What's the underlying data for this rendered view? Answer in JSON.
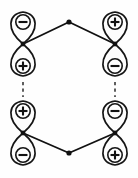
{
  "figure": {
    "background_color": "#fefefe",
    "line_color": "#111111",
    "lobe_fill_color": "#fdfdfd"
  },
  "orbitals": [
    {
      "id": "orbital-top-left",
      "name": "top-left-orbital",
      "center_x": 23,
      "node_y": 44,
      "top_lobe_sign": "−",
      "top_lobe_sign_name": "minus",
      "bottom_lobe_sign": "+",
      "bottom_lobe_sign_name": "plus"
    },
    {
      "id": "orbital-top-right",
      "name": "top-right-orbital",
      "center_x": 115,
      "node_y": 44,
      "top_lobe_sign": "+",
      "top_lobe_sign_name": "plus",
      "bottom_lobe_sign": "−",
      "bottom_lobe_sign_name": "minus"
    },
    {
      "id": "orbital-bottom-left",
      "name": "bottom-left-orbital",
      "center_x": 23,
      "node_y": 133,
      "top_lobe_sign": "+",
      "top_lobe_sign_name": "plus",
      "bottom_lobe_sign": "−",
      "bottom_lobe_sign_name": "minus"
    },
    {
      "id": "orbital-bottom-right",
      "name": "bottom-right-orbital",
      "center_x": 115,
      "node_y": 133,
      "top_lobe_sign": "−",
      "top_lobe_sign_name": "minus",
      "bottom_lobe_sign": "+",
      "bottom_lobe_sign_name": "plus"
    }
  ],
  "vertices": [
    {
      "id": "vertex-top",
      "name": "top-apex-vertex",
      "x": 69,
      "y": 22
    },
    {
      "id": "vertex-bottom",
      "name": "bottom-apex-vertex",
      "x": 69,
      "y": 153
    }
  ],
  "bonds": [
    {
      "id": "bond-top-left",
      "name": "bond-top-left",
      "x1": 23,
      "y1": 44,
      "x2": 69,
      "y2": 22,
      "style": "solid"
    },
    {
      "id": "bond-top-right",
      "name": "bond-top-right",
      "x1": 69,
      "y1": 22,
      "x2": 115,
      "y2": 44,
      "style": "solid"
    },
    {
      "id": "bond-bottom-left",
      "name": "bond-bottom-left",
      "x1": 23,
      "y1": 133,
      "x2": 69,
      "y2": 153,
      "style": "solid"
    },
    {
      "id": "bond-bottom-right",
      "name": "bond-bottom-right",
      "x1": 69,
      "y1": 153,
      "x2": 115,
      "y2": 133,
      "style": "solid"
    }
  ],
  "partial_bonds": [
    {
      "id": "partial-bond-left",
      "name": "dashed-bond-left",
      "x1": 23,
      "y1": 82,
      "x2": 23,
      "y2": 97,
      "style": "dashed"
    },
    {
      "id": "partial-bond-right",
      "name": "dashed-bond-right",
      "x1": 115,
      "y1": 82,
      "x2": 115,
      "y2": 97,
      "style": "dashed"
    }
  ],
  "geometry": {
    "lobe_half_height": 32,
    "lobe_max_width": 30,
    "sign_circle_radius": 7.2,
    "sign_offset_from_node": 22,
    "vertex_dot_radius": 2.6,
    "node_dot_radius": 2.4
  }
}
